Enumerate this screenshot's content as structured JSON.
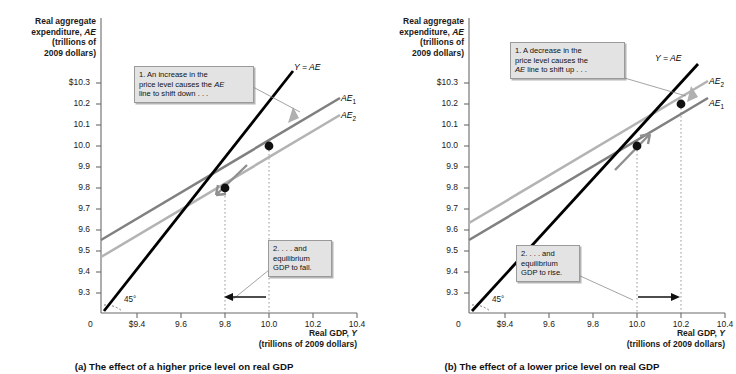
{
  "figure": {
    "axes": {
      "y_title": "Real aggregate\nexpenditure, AE\n(trillions of\n2009 dollars)",
      "x_title": "Real GDP, Y\n(trillions of 2009 dollars)",
      "origin_label": "0",
      "angle_label": "45°",
      "y_ticks": [
        "$10.3",
        "10.2",
        "10.1",
        "10.0",
        "9.9",
        "9.8",
        "9.7",
        "9.6",
        "9.5",
        "9.4",
        "9.3"
      ],
      "y_tick_values": [
        10.3,
        10.2,
        10.1,
        10.0,
        9.9,
        9.8,
        9.7,
        9.6,
        9.5,
        9.4,
        9.3
      ],
      "x_ticks": [
        "$9.4",
        "9.6",
        "9.8",
        "10.0",
        "10.2",
        "10.4"
      ],
      "x_tick_values": [
        9.4,
        9.6,
        9.8,
        10.0,
        10.2,
        10.4
      ],
      "ylim": [
        9.25,
        10.35
      ],
      "xlim": [
        9.3,
        10.45
      ]
    },
    "colors": {
      "forty_five_line": "#000000",
      "ae1_panel_a": "#808080",
      "ae2_panel_a": "#b3b3b3",
      "ae1_panel_b": "#808080",
      "ae2_panel_b": "#b3b3b3",
      "callout_fill": "#e3e3e3",
      "callout_border": "#9a9a9a",
      "dotted_guide": "#9a9a9a",
      "shift_arrow": "#9a9a9a"
    },
    "panels": [
      {
        "id": "a",
        "caption": "(a) The effect of a higher price level on real GDP",
        "callout_1": {
          "line1": "1. An increase in the",
          "line2": "price level causes the AE",
          "line3": "line to shift down . . ."
        },
        "callout_2": {
          "line1": "2. . . . and",
          "line2": "equilibrium",
          "line3": "GDP to fall."
        },
        "line_labels": {
          "identity": "Y = AE",
          "ae_upper": "AE1",
          "ae_lower": "AE2"
        },
        "equilibria": [
          {
            "label": "initial",
            "x": 10.0,
            "y": 10.0
          },
          {
            "label": "new",
            "x": 9.8,
            "y": 9.8
          }
        ],
        "guide_x_values": [
          9.8,
          10.0
        ],
        "direction_arrow": "left"
      },
      {
        "id": "b",
        "caption": "(b) The effect of a lower price level on real GDP",
        "callout_1": {
          "line1": "1. A decrease in the",
          "line2": "price level causes the",
          "line3": "AE line to shift up . . ."
        },
        "callout_2": {
          "line1": "2. . . . and",
          "line2": "equilibrium",
          "line3": "GDP to rise."
        },
        "line_labels": {
          "identity": "Y = AE",
          "ae_upper": "AE2",
          "ae_lower": "AE1"
        },
        "equilibria": [
          {
            "label": "initial",
            "x": 10.0,
            "y": 10.0
          },
          {
            "label": "new",
            "x": 10.2,
            "y": 10.2
          }
        ],
        "guide_x_values": [
          10.0,
          10.2
        ],
        "direction_arrow": "right"
      }
    ]
  },
  "chart_data": {
    "type": "line",
    "xlabel": "Real GDP, Y (trillions of 2009 dollars)",
    "ylabel": "Real aggregate expenditure, AE (trillions of 2009 dollars)",
    "xlim": [
      9.3,
      10.45
    ],
    "ylim": [
      9.25,
      10.35
    ],
    "grid": false,
    "legend_position": "right-of-line-ends",
    "panels": [
      {
        "name": "(a) The effect of a higher price level on real GDP",
        "series": [
          {
            "name": "Y = AE",
            "color": "#000000",
            "x": [
              9.3,
              10.35
            ],
            "y": [
              9.3,
              10.35
            ]
          },
          {
            "name": "AE1",
            "color": "#808080",
            "x": [
              9.3,
              10.42
            ],
            "y": [
              9.545,
              10.225
            ]
          },
          {
            "name": "AE2",
            "color": "#b3b3b3",
            "x": [
              9.3,
              10.42
            ],
            "y": [
              9.465,
              10.145
            ]
          }
        ],
        "points": [
          {
            "name": "initial equilibrium",
            "x": 10.0,
            "y": 10.0
          },
          {
            "name": "new equilibrium",
            "x": 9.8,
            "y": 9.8
          }
        ]
      },
      {
        "name": "(b) The effect of a lower price level on real GDP",
        "series": [
          {
            "name": "Y = AE",
            "color": "#000000",
            "x": [
              9.3,
              10.35
            ],
            "y": [
              9.3,
              10.35
            ]
          },
          {
            "name": "AE2",
            "color": "#b3b3b3",
            "x": [
              9.3,
              10.42
            ],
            "y": [
              9.625,
              10.305
            ]
          },
          {
            "name": "AE1",
            "color": "#808080",
            "x": [
              9.3,
              10.42
            ],
            "y": [
              9.545,
              10.225
            ]
          }
        ],
        "points": [
          {
            "name": "initial equilibrium",
            "x": 10.0,
            "y": 10.0
          },
          {
            "name": "new equilibrium",
            "x": 10.2,
            "y": 10.2
          }
        ]
      }
    ]
  }
}
